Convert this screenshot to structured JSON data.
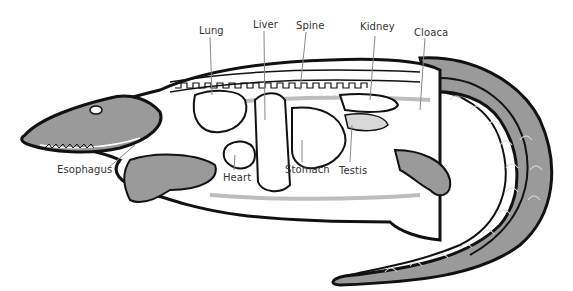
{
  "diagram": {
    "labels": {
      "lung": "Lung",
      "liver": "Liver",
      "spine": "Spine",
      "kidney": "Kidney",
      "cloaca": "Cloaca",
      "esophagus": "Esophagus",
      "heart": "Heart",
      "stomach": "Stomach",
      "testis": "Testis"
    },
    "colors": {
      "outline": "#111111",
      "skin": "#9a9a9a",
      "organ_fill": "#ffffff",
      "vessel": "#bdbdbd",
      "leader_line": "#888888",
      "label_text": "#333333"
    }
  }
}
